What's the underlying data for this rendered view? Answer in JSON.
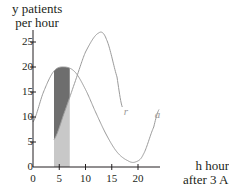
{
  "chart_data": {
    "type": "line",
    "title": "",
    "ylabel_line1": "y patients",
    "ylabel_line2": "per hour",
    "xlabel_line1": "h hours",
    "xlabel_line2": "after 3 A.M.",
    "xlim": [
      0,
      24
    ],
    "ylim": [
      0,
      28
    ],
    "x_ticks": [
      0,
      5,
      10,
      15,
      20
    ],
    "y_ticks": [
      0,
      5,
      10,
      15,
      20,
      25
    ],
    "grid": false,
    "series": [
      {
        "name": "a",
        "label": "a",
        "x": [
          0,
          2,
          4,
          6,
          8,
          10,
          12,
          14,
          16,
          18,
          19.5,
          21,
          23,
          24
        ],
        "values": [
          9,
          15,
          19.2,
          20,
          19,
          15.5,
          10.8,
          6.4,
          3,
          1.3,
          1,
          2.5,
          8,
          11.5
        ]
      },
      {
        "name": "r",
        "label": "r",
        "x": [
          4,
          6,
          8,
          10,
          12.5,
          14,
          16,
          17
        ],
        "values": [
          5.5,
          11,
          17,
          23,
          26.8,
          25.5,
          18,
          12
        ]
      }
    ],
    "shaded_region": {
      "x_from": 4,
      "x_to": 7,
      "light_fill": "area under r",
      "dark_fill": "area between r and a"
    },
    "colors": {
      "axis": "#231f20",
      "curve": "#9a9a9a",
      "light_shade": "#c8c8c8",
      "dark_shade": "#6e6e6e"
    }
  }
}
